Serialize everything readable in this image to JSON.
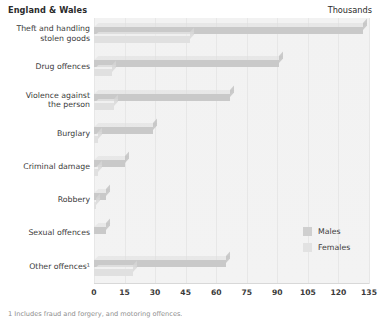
{
  "header": {
    "region_label": "England & Wales",
    "units_label": "Thousands"
  },
  "footnote": "1 Includes fraud and forgery, and motoring offences.",
  "legend": {
    "position": "bottom-right",
    "entries": [
      {
        "label": "Males",
        "color": "#cfcfcf"
      },
      {
        "label": "Females",
        "color": "#e2e2e2"
      }
    ]
  },
  "chart_data": {
    "type": "bar",
    "orientation": "horizontal",
    "title": "England & Wales",
    "subtitle": "Thousands",
    "xlabel": "",
    "ylabel": "",
    "xlim": [
      0,
      135
    ],
    "xticks": [
      0,
      15,
      30,
      45,
      60,
      75,
      90,
      105,
      120,
      135
    ],
    "grid": true,
    "grid_axis": "x",
    "legend_position": "bottom-right",
    "categories": [
      "Theft and handling\nstolen goods",
      "Drug offences",
      "Violence against\nthe person",
      "Burglary",
      "Criminal damage",
      "Robbery",
      "Sexual offences",
      "Other offences¹"
    ],
    "series": [
      {
        "name": "Males",
        "color": "#c9c9c9",
        "values": [
          132,
          91,
          67,
          29,
          15,
          6,
          6,
          65
        ]
      },
      {
        "name": "Females",
        "color": "#e0e0e0",
        "values": [
          47,
          9,
          10,
          2,
          2,
          1,
          0,
          19
        ]
      }
    ]
  }
}
